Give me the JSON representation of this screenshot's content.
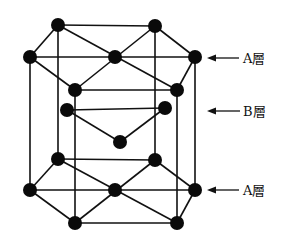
{
  "labels": {
    "top": "A層",
    "middle": "B層",
    "bottom": "A層"
  },
  "colors": {
    "atom": "#0a0a0a",
    "line": "#111111",
    "background": "#ffffff"
  },
  "layers": [
    {
      "name": "A (top)",
      "atoms": [
        [
          58,
          25
        ],
        [
          155,
          26
        ],
        [
          195,
          57
        ],
        [
          177,
          90
        ],
        [
          75,
          90
        ],
        [
          30,
          57
        ],
        [
          115,
          57
        ]
      ]
    },
    {
      "name": "B (middle)",
      "atoms": [
        [
          67,
          110
        ],
        [
          165,
          108
        ],
        [
          120,
          142
        ]
      ]
    },
    {
      "name": "A (bottom)",
      "atoms": [
        [
          58,
          159
        ],
        [
          155,
          160
        ],
        [
          195,
          190
        ],
        [
          177,
          223
        ],
        [
          75,
          223
        ],
        [
          30,
          190
        ],
        [
          115,
          190
        ]
      ]
    }
  ]
}
